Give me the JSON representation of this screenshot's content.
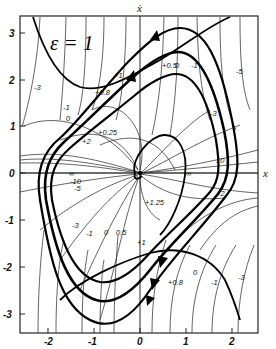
{
  "figure": {
    "parameter_label": "ε = 1",
    "x_axis_title": "x",
    "y_axis_title": "ẋ",
    "x_ticks": [
      "-2",
      "-1",
      "0",
      "1",
      "2"
    ],
    "y_ticks": [
      "3",
      "2",
      "1",
      "0",
      "-1",
      "-2",
      "-3"
    ],
    "isocline_labels": {
      "inf": "∞",
      "m10_left": "-10",
      "m5_left": "-5",
      "m3_left": "-3",
      "m1_left": "-1",
      "zero_left": "0",
      "p025": "+0.25",
      "p2_left": "+2",
      "p08": "+0.8",
      "p1_top": "+1",
      "p05_top": "+0.5",
      "zero_top": "0",
      "m1_top": "-1",
      "m3_top": "-3",
      "m5_top": "-5",
      "ten_right": "10",
      "inf_right": "∞",
      "p2_right": "+2",
      "p125": "+1.25",
      "m3_right": "-3",
      "m1_bottom": "-1",
      "zero_bottom": "0",
      "p05_bottom": "0.5",
      "p1_bottom": "+1",
      "p08_bottom": "+0.8",
      "zero_bottom2": "0",
      "m1_bottom2": "-1",
      "m3_bottom2": "-3",
      "m3_top_left": "-3"
    }
  }
}
